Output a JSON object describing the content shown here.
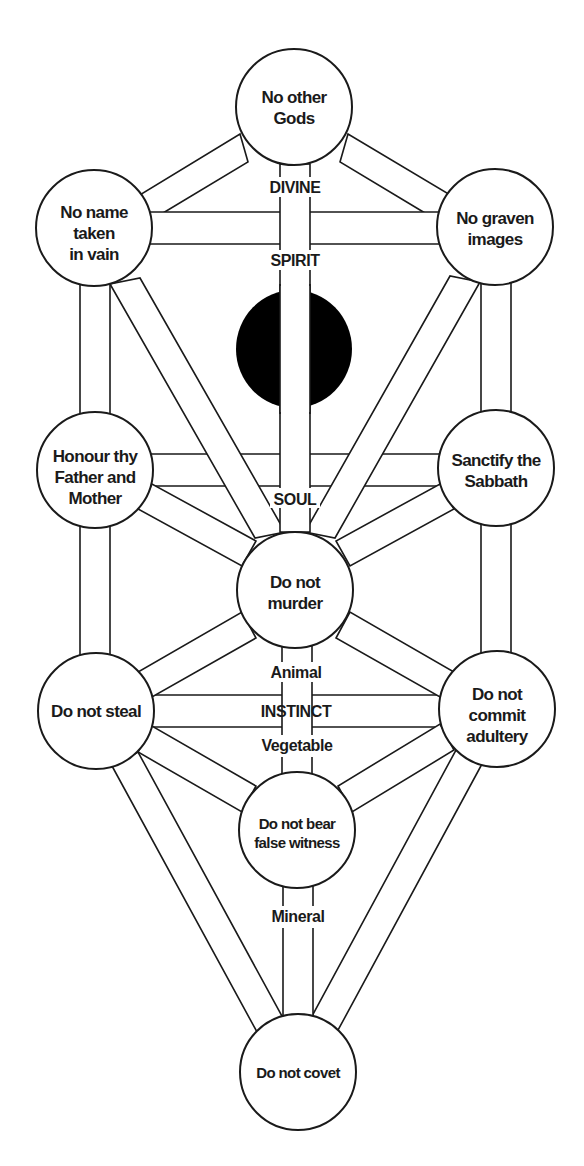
{
  "diagram": {
    "colors": {
      "line": "#1a1a1a",
      "background": "#ffffff",
      "daat": "#000000"
    },
    "nodes": [
      {
        "id": "n1",
        "lines": [
          "No other",
          "Gods"
        ],
        "cx": 294,
        "cy": 107
      },
      {
        "id": "n2",
        "lines": [
          "No name",
          "taken",
          "in vain"
        ],
        "cx": 94,
        "cy": 228
      },
      {
        "id": "n3",
        "lines": [
          "No graven",
          "images"
        ],
        "cx": 495,
        "cy": 227
      },
      {
        "id": "n4",
        "lines": [
          "Honour thy",
          "Father and",
          "Mother"
        ],
        "cx": 95,
        "cy": 470
      },
      {
        "id": "n5",
        "lines": [
          "Sanctify the",
          "Sabbath"
        ],
        "cx": 496,
        "cy": 468
      },
      {
        "id": "n6",
        "lines": [
          "Do not",
          "murder"
        ],
        "cx": 295,
        "cy": 590
      },
      {
        "id": "n7",
        "lines": [
          "Do not steal"
        ],
        "cx": 96,
        "cy": 711
      },
      {
        "id": "n8",
        "lines": [
          "Do not",
          "commit",
          "adultery"
        ],
        "cx": 497,
        "cy": 709
      },
      {
        "id": "n9",
        "lines": [
          "Do not bear",
          "false witness"
        ],
        "cx": 297,
        "cy": 830
      },
      {
        "id": "n10",
        "lines": [
          "Do not covet"
        ],
        "cx": 298,
        "cy": 1072
      }
    ],
    "node_text": {
      "n1": {
        "l1": "No other",
        "l2": "Gods"
      },
      "n2": {
        "l1": "No name",
        "l2": "taken",
        "l3": "in vain"
      },
      "n3": {
        "l1": "No graven",
        "l2": "images"
      },
      "n4": {
        "l1": "Honour thy",
        "l2": "Father and",
        "l3": "Mother"
      },
      "n5": {
        "l1": "Sanctify the",
        "l2": "Sabbath"
      },
      "n6": {
        "l1": "Do not",
        "l2": "murder"
      },
      "n7": {
        "l1": "Do not steal"
      },
      "n8": {
        "l1": "Do not",
        "l2": "commit",
        "l3": "adultery"
      },
      "n9": {
        "l1": "Do not bear",
        "l2": "false witness"
      },
      "n10": {
        "l1": "Do not covet"
      }
    },
    "hidden_node": {
      "id": "daat",
      "shape": "filled-ellipse",
      "cx": 294,
      "cy": 349
    },
    "level_labels": {
      "divine": "DIVINE",
      "spirit": "SPIRIT",
      "soul": "SOUL",
      "animal": "Animal",
      "instinct": "INSTINCT",
      "vegetable": "Vegetable",
      "mineral": "Mineral"
    },
    "paths": [
      [
        "n1",
        "n2"
      ],
      [
        "n1",
        "n3"
      ],
      [
        "n2",
        "n3"
      ],
      [
        "n1",
        "n6"
      ],
      [
        "n2",
        "n4"
      ],
      [
        "n3",
        "n5"
      ],
      [
        "n2",
        "n6"
      ],
      [
        "n3",
        "n6"
      ],
      [
        "n4",
        "n5"
      ],
      [
        "n4",
        "n6"
      ],
      [
        "n5",
        "n6"
      ],
      [
        "n4",
        "n7"
      ],
      [
        "n5",
        "n8"
      ],
      [
        "n6",
        "n7"
      ],
      [
        "n6",
        "n8"
      ],
      [
        "n7",
        "n8"
      ],
      [
        "n6",
        "n9"
      ],
      [
        "n7",
        "n9"
      ],
      [
        "n8",
        "n9"
      ],
      [
        "n7",
        "n10"
      ],
      [
        "n8",
        "n10"
      ],
      [
        "n9",
        "n10"
      ]
    ]
  }
}
